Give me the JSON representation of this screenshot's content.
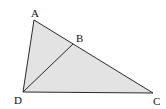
{
  "figure": {
    "type": "geometry-triangle",
    "fill_color": "#e3e3e3",
    "stroke_color": "#2a2a2a",
    "points": {
      "A": {
        "label": "A"
      },
      "B": {
        "label": "B"
      },
      "C": {
        "label": "C"
      },
      "D": {
        "label": "D"
      }
    },
    "segments": [
      "AC",
      "AD",
      "DC",
      "DB"
    ]
  }
}
